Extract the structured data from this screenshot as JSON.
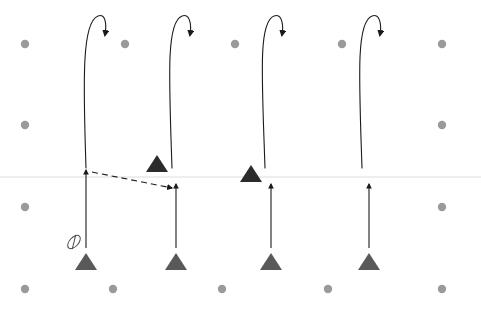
{
  "canvas": {
    "width": 481,
    "height": 310,
    "background": "#ffffff",
    "title": "Particle trajectory schematic"
  },
  "colors": {
    "dot_gray": "#9a9a9a",
    "triangle_gray": "#595959",
    "triangle_dark": "#2b2b2b",
    "stroke_black": "#1a1a1a",
    "baseline_gray": "#dcdcdc",
    "marker_gray": "#4a4a4a"
  },
  "baseline": {
    "label": "horizontal-reference-line",
    "y": 177,
    "x1": 0,
    "x2": 481,
    "color": "#dcdcdc",
    "width": 1
  },
  "dot_grid": {
    "label": "background-dot-grid",
    "radius": 4.2,
    "color": "#9a9a9a",
    "rows": [
      {
        "y": 44,
        "xs": [
          25,
          125,
          235,
          342,
          442
        ]
      },
      {
        "y": 125,
        "xs": [
          25,
          442
        ]
      },
      {
        "y": 207,
        "xs": [
          25,
          442
        ]
      },
      {
        "y": 289,
        "xs": [
          25,
          113,
          222,
          328,
          442
        ]
      }
    ]
  },
  "curved_arrows": {
    "label": "looping-trajectory-arrows",
    "count": 4,
    "color": "#1a1a1a",
    "stroke_width": 1.1,
    "items": [
      {
        "name": "curved-arrow-1",
        "start_x": 86,
        "start_y": 168,
        "peak_x": 98,
        "peak_y": 16,
        "end_x": 105,
        "end_y": 35
      },
      {
        "name": "curved-arrow-2",
        "start_x": 172,
        "start_y": 168,
        "peak_x": 182,
        "peak_y": 16,
        "end_x": 190,
        "end_y": 35
      },
      {
        "name": "curved-arrow-3",
        "start_x": 265,
        "start_y": 168,
        "peak_x": 274,
        "peak_y": 16,
        "end_x": 282,
        "end_y": 35
      },
      {
        "name": "curved-arrow-4",
        "start_x": 362,
        "start_y": 168,
        "peak_x": 372,
        "peak_y": 16,
        "end_x": 380,
        "end_y": 35
      }
    ]
  },
  "vertical_arrows": {
    "label": "upward-motion-arrows",
    "count": 4,
    "color": "#1a1a1a",
    "stroke_width": 1.1,
    "items": [
      {
        "name": "vertical-arrow-1",
        "x": 86,
        "tail_y": 248,
        "head_y": 170
      },
      {
        "name": "vertical-arrow-2",
        "x": 176,
        "tail_y": 248,
        "head_y": 184
      },
      {
        "name": "vertical-arrow-3",
        "x": 271,
        "tail_y": 248,
        "head_y": 184
      },
      {
        "name": "vertical-arrow-4",
        "x": 369,
        "tail_y": 248,
        "head_y": 184
      }
    ]
  },
  "dashed_arrow": {
    "name": "dashed-transfer-arrow",
    "label": "dashed-connector",
    "x1": 92,
    "y1": 172,
    "x2": 172,
    "y2": 188,
    "color": "#1a1a1a",
    "dash_pattern": "6 4",
    "stroke_width": 1.1
  },
  "dark_triangles": {
    "label": "dark-marker-triangles",
    "color": "#2b2b2b",
    "half_width": 11,
    "height": 17,
    "items": [
      {
        "name": "dark-triangle-1",
        "cx": 157,
        "base_y": 172
      },
      {
        "name": "dark-triangle-2",
        "cx": 251,
        "base_y": 182
      },
      {
        "name": "dark-triangle-3",
        "cx": 345,
        "base_y": 182,
        "hidden": true
      }
    ]
  },
  "gray_triangles": {
    "label": "gray-base-triangles",
    "color": "#595959",
    "half_width": 11,
    "height": 17,
    "base_y": 270,
    "items": [
      {
        "name": "gray-triangle-1",
        "cx": 86
      },
      {
        "name": "gray-triangle-2",
        "cx": 176
      },
      {
        "name": "gray-triangle-3",
        "cx": 271
      },
      {
        "name": "gray-triangle-4",
        "cx": 369
      }
    ]
  },
  "slashed_ellipse": {
    "name": "slashed-ellipse-icon",
    "label": "no-entry-marker",
    "cx": 74,
    "cy": 242,
    "rx": 8,
    "ry": 4.5,
    "rotation": -48,
    "color": "#4a4a4a",
    "stroke_width": 1
  }
}
